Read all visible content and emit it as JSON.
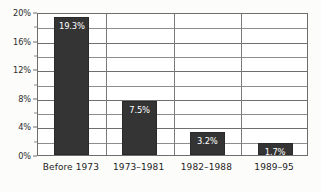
{
  "chart_data": {
    "type": "bar",
    "title": "",
    "subtitle": "",
    "xlabel": "",
    "ylabel": "",
    "categories": [
      "Before 1973",
      "1973–1981",
      "1982–1988",
      "1989–95"
    ],
    "values": [
      19.3,
      7.5,
      3.2,
      1.7
    ],
    "value_labels": [
      "19.3%",
      "7.5%",
      "3.2%",
      "1.7%"
    ],
    "ylim": [
      0,
      20
    ],
    "ytick_labels": [
      "0%",
      "4%",
      "8%",
      "12%",
      "16%",
      "20%"
    ],
    "ytick_values": [
      0,
      4,
      8,
      12,
      16,
      20
    ],
    "minor_gridline_values": [
      2,
      6,
      10,
      14,
      18
    ],
    "grid": "horizontal-major-and-minor",
    "legend": "none",
    "bar_color": "#343434",
    "value_label_color": "#ffffff",
    "gridline_color": "#8d8d8d",
    "axis_color": "#6d6d6d",
    "background_color": "#fcfcfa"
  }
}
